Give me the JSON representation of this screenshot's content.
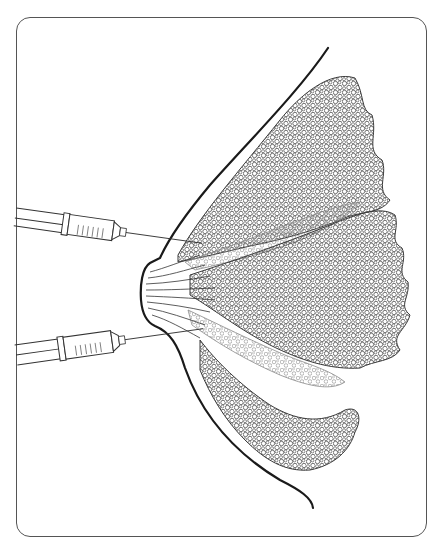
{
  "figure": {
    "type": "anatomical-line-illustration",
    "caption": "",
    "colors": {
      "background": "#ffffff",
      "frame": "#555555",
      "skin_outline": "#1a1a1a",
      "lobule_stroke": "#3a3a3a",
      "lobule_light_stroke": "#8a8a8a",
      "duct": "#333333",
      "syringe": "#333333"
    },
    "elements": {
      "frame": "rounded-rectangle-border",
      "skin_outline": "breast-profile-curve",
      "nipple": "nipple-profile",
      "ducts": "lactiferous-duct-lines",
      "lobes": [
        "upper-lobe",
        "upper-middle-lobe",
        "central-lobe",
        "lower-middle-lobe",
        "lower-lobe"
      ],
      "syringes": [
        {
          "name": "upper-syringe",
          "target": "upper-duct"
        },
        {
          "name": "lower-syringe",
          "target": "lower-duct"
        }
      ]
    }
  }
}
